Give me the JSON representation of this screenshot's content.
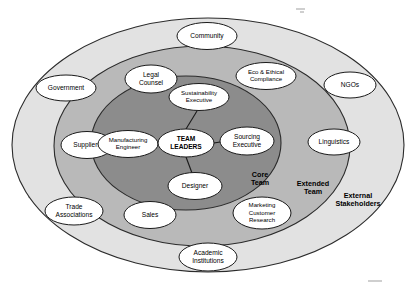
{
  "diagram": {
    "zones": [
      {
        "id": "external",
        "label": "External\nStakeholders",
        "label_line1": "External",
        "label_line2": "Stakeholders",
        "fill": "#e2e2e2",
        "cx": 208,
        "cy": 145,
        "rx": 196,
        "ry": 127,
        "label_x": 358,
        "label_y": 196
      },
      {
        "id": "extended",
        "label": "Extended\nTeam",
        "label_line1": "Extended",
        "label_line2": "Team",
        "fill": "#b9b9b9",
        "cx": 202,
        "cy": 146,
        "rx": 148,
        "ry": 100,
        "label_x": 313,
        "label_y": 184
      },
      {
        "id": "core",
        "label": "Core\nTeam",
        "label_line1": "Core",
        "label_line2": "Team",
        "fill": "#8c8c8c",
        "cx": 186,
        "cy": 143,
        "rx": 95,
        "ry": 67,
        "label_x": 260,
        "label_y": 175
      }
    ],
    "center_node": {
      "id": "team-leaders",
      "line1": "TEAM",
      "line2": "LEADERS",
      "cx": 186,
      "cy": 143,
      "rx": 28,
      "ry": 14,
      "bold": true
    },
    "core_nodes": [
      {
        "id": "sustainability-executive",
        "line1": "Sustainability",
        "line2": "Executive",
        "cx": 199,
        "cy": 97,
        "rx": 30,
        "ry": 13.5,
        "small": true
      },
      {
        "id": "manufacturing-engineer",
        "line1": "Manufacturing",
        "line2": "Engineer",
        "cx": 128,
        "cy": 144,
        "rx": 30,
        "ry": 13.5,
        "small": true
      },
      {
        "id": "sourcing-executive",
        "line1": "Sourcing",
        "line2": "Executive",
        "cx": 247,
        "cy": 141,
        "rx": 27,
        "ry": 14
      },
      {
        "id": "designer",
        "line1": "Designer",
        "line2": "",
        "cx": 195,
        "cy": 186,
        "rx": 27,
        "ry": 13.5
      }
    ],
    "connectors": [
      {
        "id": "leaders-to-sustainability",
        "x1": 186,
        "y1": 129,
        "x2": 197,
        "y2": 111
      },
      {
        "id": "leaders-to-manufacturing",
        "x1": 158,
        "y1": 143,
        "x2": 157,
        "y2": 144
      },
      {
        "id": "leaders-to-sourcing",
        "x1": 214,
        "y1": 143,
        "x2": 220,
        "y2": 142
      },
      {
        "id": "leaders-to-designer",
        "x1": 186,
        "y1": 157,
        "x2": 192,
        "y2": 173
      }
    ],
    "extended_nodes": [
      {
        "id": "legal-counsel",
        "line1": "Legal",
        "line2": "Counsel",
        "cx": 151,
        "cy": 79,
        "rx": 26,
        "ry": 14
      },
      {
        "id": "eco-ethical-compliance",
        "line1": "Eco & Ethical",
        "line2": "Compliance",
        "cx": 266,
        "cy": 76,
        "rx": 30,
        "ry": 13.5,
        "small": true
      },
      {
        "id": "suppliers",
        "line1": "Suppliers",
        "line2": "",
        "cx": 87,
        "cy": 145,
        "rx": 26,
        "ry": 13.5
      },
      {
        "id": "linguistics",
        "line1": "Linguistics",
        "line2": "",
        "cx": 334,
        "cy": 142,
        "rx": 26,
        "ry": 13
      },
      {
        "id": "sales",
        "line1": "Sales",
        "line2": "",
        "cx": 150,
        "cy": 215,
        "rx": 26,
        "ry": 13.5
      },
      {
        "id": "marketing-customer-research",
        "line1": "Marketing",
        "line2": "Customer",
        "line3": "Research",
        "cx": 262,
        "cy": 213,
        "rx": 29,
        "ry": 16,
        "small": true
      }
    ],
    "external_nodes": [
      {
        "id": "community",
        "line1": "Community",
        "line2": "",
        "cx": 207,
        "cy": 36,
        "rx": 30,
        "ry": 13.5
      },
      {
        "id": "government",
        "line1": "Government",
        "line2": "",
        "cx": 66,
        "cy": 88,
        "rx": 30,
        "ry": 13
      },
      {
        "id": "ngos",
        "line1": "NGOs",
        "line2": "",
        "cx": 350,
        "cy": 85,
        "rx": 26,
        "ry": 13
      },
      {
        "id": "trade-associations",
        "line1": "Trade",
        "line2": "Associations",
        "cx": 74,
        "cy": 211,
        "rx": 29,
        "ry": 14
      },
      {
        "id": "academic-institutions",
        "line1": "Academic",
        "line2": "Institutions",
        "cx": 208,
        "cy": 257,
        "rx": 29,
        "ry": 14
      }
    ]
  }
}
